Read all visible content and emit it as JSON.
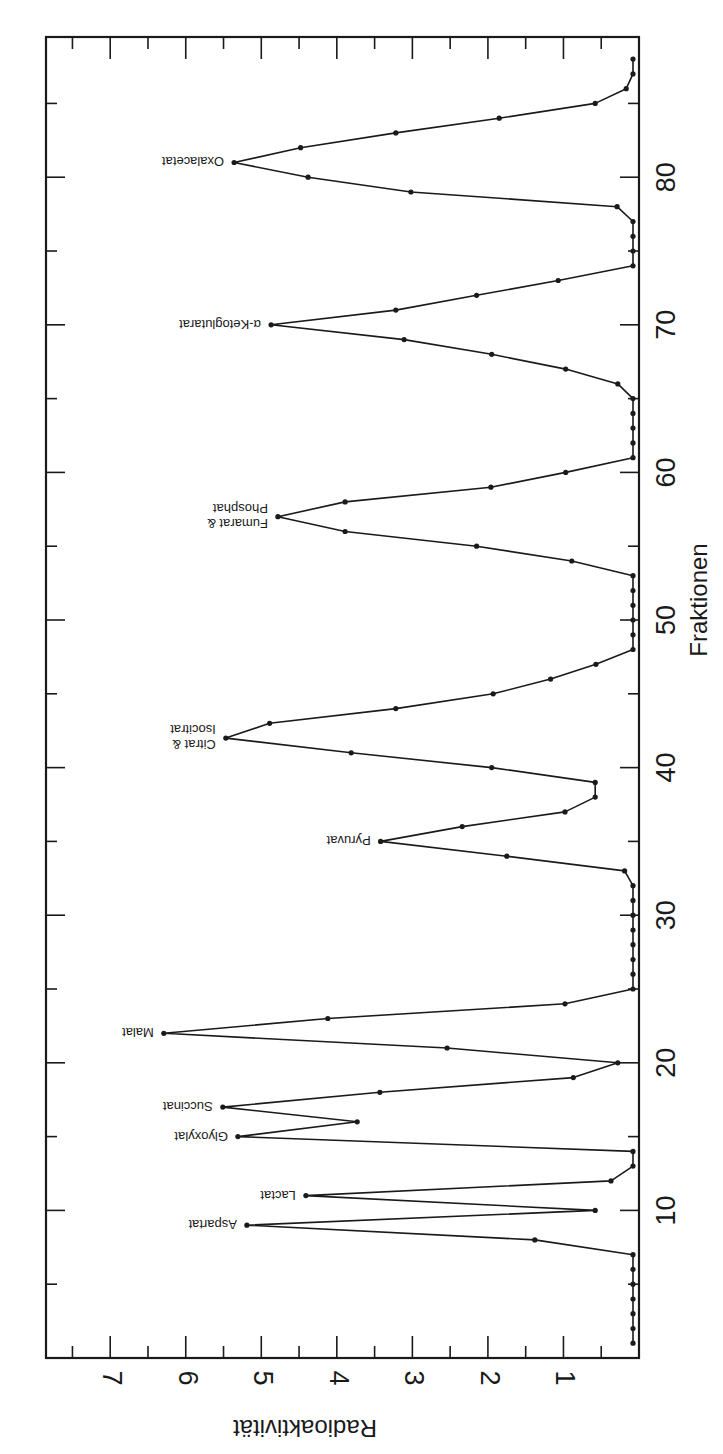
{
  "chart_data": {
    "type": "line",
    "title": "",
    "orientation": "rotated 90° clockwise: fraction axis vertical on right (increasing upward), radioactivity axis horizontal at bottom (increasing leftward)",
    "xlabel": "Fraktionen",
    "ylabel": "Radioaktivität",
    "xlim": [
      0,
      89.5
    ],
    "ylim": [
      0,
      7.85
    ],
    "x_ticks_major": [
      10,
      20,
      30,
      40,
      50,
      60,
      70,
      80
    ],
    "x_tick_labels": [
      "10",
      "20",
      "30",
      "40",
      "50",
      "60",
      "70",
      "80"
    ],
    "x_ticks_minor_step": 5,
    "y_ticks_major": [
      1,
      2,
      3,
      4,
      5,
      6,
      7
    ],
    "y_tick_labels": [
      "1",
      "2",
      "3",
      "4",
      "5",
      "6",
      "7"
    ],
    "y_ticks_minor_step": 0.5,
    "grid": false,
    "legend": null,
    "series": [
      {
        "name": "Radioaktivität",
        "marker": "dot",
        "x": [
          1,
          2,
          3,
          4,
          5,
          6,
          7,
          8,
          9,
          10,
          11,
          12,
          13,
          14,
          15,
          16,
          17,
          18,
          19,
          20,
          21,
          22,
          23,
          24,
          25,
          26,
          27,
          28,
          29,
          30,
          31,
          32,
          33,
          34,
          35,
          36,
          37,
          38,
          39,
          40,
          41,
          42,
          43,
          44,
          45,
          46,
          47,
          48,
          49,
          50,
          51,
          52,
          53,
          54,
          55,
          56,
          57,
          58,
          59,
          60,
          61,
          62,
          63,
          64,
          65,
          66,
          67,
          68,
          69,
          70,
          71,
          72,
          73,
          74,
          75,
          76,
          77,
          78,
          79,
          80,
          81,
          82,
          83,
          84,
          85,
          86,
          87,
          88
        ],
        "values": [
          0.08,
          0.08,
          0.08,
          0.08,
          0.08,
          0.08,
          0.08,
          1.38,
          5.19,
          0.58,
          4.41,
          0.37,
          0.08,
          0.08,
          5.31,
          3.73,
          5.51,
          3.43,
          0.87,
          0.28,
          2.54,
          6.29,
          4.12,
          0.98,
          0.08,
          0.08,
          0.08,
          0.08,
          0.08,
          0.08,
          0.08,
          0.08,
          0.19,
          1.75,
          3.42,
          2.34,
          0.98,
          0.58,
          0.58,
          1.95,
          3.81,
          5.47,
          4.89,
          3.22,
          1.93,
          1.17,
          0.57,
          0.08,
          0.08,
          0.08,
          0.08,
          0.08,
          0.08,
          0.89,
          2.15,
          3.89,
          4.78,
          3.89,
          1.96,
          0.97,
          0.08,
          0.08,
          0.08,
          0.08,
          0.08,
          0.28,
          0.97,
          1.95,
          3.11,
          4.87,
          3.22,
          2.15,
          1.07,
          0.08,
          0.08,
          0.08,
          0.08,
          0.29,
          3.02,
          4.38,
          5.36,
          4.48,
          3.22,
          1.85,
          0.58,
          0.17,
          0.08,
          0.08
        ]
      }
    ],
    "annotations": [
      {
        "text": [
          "Aspartat"
        ],
        "x": 9,
        "y": 5.19
      },
      {
        "text": [
          "Lactat"
        ],
        "x": 11,
        "y": 4.41
      },
      {
        "text": [
          "Glyoxylat"
        ],
        "x": 15,
        "y": 5.31
      },
      {
        "text": [
          "Succinat"
        ],
        "x": 17,
        "y": 5.51
      },
      {
        "text": [
          "Malat"
        ],
        "x": 22,
        "y": 6.29
      },
      {
        "text": [
          "Pyruvat"
        ],
        "x": 35,
        "y": 3.42
      },
      {
        "text": [
          "Citrat &",
          "Isocitrat"
        ],
        "x": 42,
        "y": 5.47
      },
      {
        "text": [
          "Fumarat &",
          "Phosphat"
        ],
        "x": 57,
        "y": 4.78
      },
      {
        "text": [
          "α-Ketoglutarat"
        ],
        "x": 70,
        "y": 4.87
      },
      {
        "text": [
          "Oxalacetat"
        ],
        "x": 81,
        "y": 5.36
      }
    ]
  },
  "axes": {
    "x_title": "Fraktionen",
    "y_title": "Radioaktivität"
  }
}
